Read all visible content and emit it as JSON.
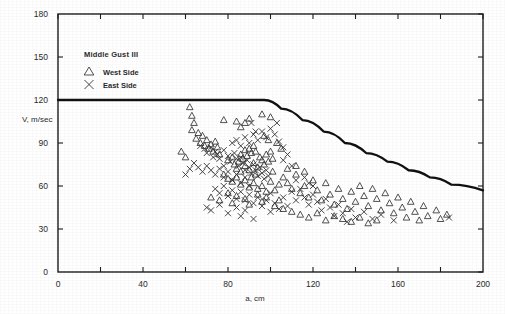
{
  "chart_data": {
    "type": "scatter",
    "title": "",
    "xlabel": "a, cm",
    "ylabel": "V, m/sec",
    "xlim": [
      0,
      200
    ],
    "ylim": [
      0,
      180
    ],
    "xticks": [
      0,
      40,
      80,
      120,
      160,
      200
    ],
    "xticks_minor": [
      20,
      60,
      100,
      140,
      180
    ],
    "yticks": [
      0,
      30,
      60,
      90,
      120,
      150,
      180
    ],
    "grid": false,
    "legend_position": "upper-left-inside",
    "legend_title": "Middle Gust III",
    "series": [
      {
        "name": "West Side",
        "marker": "triangle",
        "points": [
          [
            62,
            115
          ],
          [
            63,
            109
          ],
          [
            64,
            104
          ],
          [
            63,
            99
          ],
          [
            66,
            97
          ],
          [
            65,
            93
          ],
          [
            68,
            95
          ],
          [
            67,
            90
          ],
          [
            70,
            92
          ],
          [
            69,
            88
          ],
          [
            71,
            86
          ],
          [
            58,
            84
          ],
          [
            72,
            89
          ],
          [
            74,
            91
          ],
          [
            73,
            84
          ],
          [
            75,
            87
          ],
          [
            60,
            80
          ],
          [
            76,
            82
          ],
          [
            78,
            106
          ],
          [
            84,
            105
          ],
          [
            86,
            101
          ],
          [
            88,
            104
          ],
          [
            90,
            107
          ],
          [
            96,
            110
          ],
          [
            100,
            108
          ],
          [
            80,
            78
          ],
          [
            82,
            80
          ],
          [
            83,
            75
          ],
          [
            85,
            77
          ],
          [
            86,
            82
          ],
          [
            87,
            79
          ],
          [
            88,
            85
          ],
          [
            89,
            81
          ],
          [
            90,
            86
          ],
          [
            91,
            83
          ],
          [
            92,
            88
          ],
          [
            93,
            84
          ],
          [
            84,
            72
          ],
          [
            86,
            70
          ],
          [
            88,
            74
          ],
          [
            90,
            71
          ],
          [
            92,
            76
          ],
          [
            94,
            73
          ],
          [
            96,
            78
          ],
          [
            95,
            80
          ],
          [
            97,
            75
          ],
          [
            98,
            82
          ],
          [
            99,
            77
          ],
          [
            100,
            84
          ],
          [
            101,
            79
          ],
          [
            78,
            68
          ],
          [
            80,
            65
          ],
          [
            82,
            63
          ],
          [
            84,
            66
          ],
          [
            86,
            61
          ],
          [
            88,
            64
          ],
          [
            90,
            59
          ],
          [
            92,
            62
          ],
          [
            94,
            58
          ],
          [
            96,
            60
          ],
          [
            98,
            56
          ],
          [
            100,
            63
          ],
          [
            102,
            57
          ],
          [
            104,
            61
          ],
          [
            72,
            52
          ],
          [
            76,
            50
          ],
          [
            80,
            55
          ],
          [
            82,
            48
          ],
          [
            84,
            53
          ],
          [
            88,
            51
          ],
          [
            90,
            47
          ],
          [
            94,
            54
          ],
          [
            96,
            49
          ],
          [
            98,
            52
          ],
          [
            102,
            46
          ],
          [
            104,
            50
          ],
          [
            106,
            44
          ],
          [
            106,
            66
          ],
          [
            108,
            62
          ],
          [
            110,
            58
          ],
          [
            112,
            68
          ],
          [
            114,
            55
          ],
          [
            116,
            60
          ],
          [
            118,
            52
          ],
          [
            120,
            64
          ],
          [
            122,
            57
          ],
          [
            124,
            50
          ],
          [
            126,
            62
          ],
          [
            128,
            54
          ],
          [
            130,
            47
          ],
          [
            132,
            58
          ],
          [
            134,
            51
          ],
          [
            136,
            44
          ],
          [
            138,
            56
          ],
          [
            140,
            49
          ],
          [
            142,
            60
          ],
          [
            144,
            53
          ],
          [
            146,
            46
          ],
          [
            148,
            58
          ],
          [
            150,
            51
          ],
          [
            152,
            43
          ],
          [
            154,
            55
          ],
          [
            156,
            48
          ],
          [
            158,
            41
          ],
          [
            160,
            52
          ],
          [
            162,
            45
          ],
          [
            164,
            38
          ],
          [
            166,
            49
          ],
          [
            168,
            42
          ],
          [
            170,
            36
          ],
          [
            172,
            46
          ],
          [
            174,
            39
          ],
          [
            178,
            43
          ],
          [
            180,
            37
          ],
          [
            183,
            40
          ],
          [
            110,
            42
          ],
          [
            114,
            40
          ],
          [
            118,
            38
          ],
          [
            122,
            41
          ],
          [
            126,
            36
          ],
          [
            130,
            39
          ],
          [
            134,
            37
          ],
          [
            138,
            35
          ],
          [
            142,
            38
          ],
          [
            146,
            34
          ],
          [
            150,
            36
          ],
          [
            108,
            72
          ],
          [
            112,
            74
          ],
          [
            116,
            70
          ],
          [
            105,
            86
          ],
          [
            103,
            90
          ],
          [
            99,
            92
          ],
          [
            97,
            95
          ],
          [
            101,
            70
          ],
          [
            93,
            68
          ],
          [
            91,
            66
          ]
        ]
      },
      {
        "name": "East Side",
        "marker": "x",
        "points": [
          [
            67,
            88
          ],
          [
            69,
            86
          ],
          [
            70,
            83
          ],
          [
            72,
            87
          ],
          [
            74,
            84
          ],
          [
            73,
            80
          ],
          [
            75,
            82
          ],
          [
            76,
            79
          ],
          [
            78,
            85
          ],
          [
            80,
            81
          ],
          [
            81,
            77
          ],
          [
            83,
            83
          ],
          [
            84,
            79
          ],
          [
            85,
            74
          ],
          [
            86,
            80
          ],
          [
            87,
            76
          ],
          [
            88,
            71
          ],
          [
            89,
            78
          ],
          [
            90,
            73
          ],
          [
            91,
            69
          ],
          [
            92,
            75
          ],
          [
            93,
            71
          ],
          [
            94,
            67
          ],
          [
            95,
            73
          ],
          [
            96,
            69
          ],
          [
            97,
            65
          ],
          [
            98,
            71
          ],
          [
            99,
            67
          ],
          [
            82,
            90
          ],
          [
            84,
            92
          ],
          [
            86,
            88
          ],
          [
            88,
            94
          ],
          [
            90,
            90
          ],
          [
            92,
            96
          ],
          [
            94,
            92
          ],
          [
            96,
            98
          ],
          [
            98,
            94
          ],
          [
            100,
            100
          ],
          [
            102,
            96
          ],
          [
            104,
            91
          ],
          [
            106,
            87
          ],
          [
            64,
            76
          ],
          [
            66,
            73
          ],
          [
            68,
            70
          ],
          [
            70,
            74
          ],
          [
            72,
            71
          ],
          [
            74,
            68
          ],
          [
            76,
            72
          ],
          [
            78,
            66
          ],
          [
            80,
            70
          ],
          [
            82,
            64
          ],
          [
            84,
            68
          ],
          [
            86,
            62
          ],
          [
            88,
            66
          ],
          [
            90,
            60
          ],
          [
            74,
            58
          ],
          [
            76,
            55
          ],
          [
            78,
            60
          ],
          [
            80,
            53
          ],
          [
            82,
            57
          ],
          [
            84,
            51
          ],
          [
            86,
            56
          ],
          [
            88,
            50
          ],
          [
            90,
            54
          ],
          [
            92,
            48
          ],
          [
            94,
            52
          ],
          [
            96,
            46
          ],
          [
            98,
            50
          ],
          [
            100,
            55
          ],
          [
            70,
            45
          ],
          [
            72,
            43
          ],
          [
            76,
            47
          ],
          [
            80,
            41
          ],
          [
            84,
            45
          ],
          [
            86,
            39
          ],
          [
            88,
            43
          ],
          [
            92,
            37
          ],
          [
            100,
            42
          ],
          [
            102,
            48
          ],
          [
            104,
            44
          ],
          [
            106,
            52
          ],
          [
            108,
            46
          ],
          [
            110,
            56
          ],
          [
            112,
            50
          ],
          [
            114,
            58
          ],
          [
            116,
            52
          ],
          [
            118,
            47
          ],
          [
            120,
            54
          ],
          [
            122,
            49
          ],
          [
            124,
            43
          ],
          [
            126,
            51
          ],
          [
            128,
            45
          ],
          [
            130,
            39
          ],
          [
            132,
            47
          ],
          [
            134,
            41
          ],
          [
            136,
            35
          ],
          [
            138,
            44
          ],
          [
            140,
            38
          ],
          [
            144,
            42
          ],
          [
            148,
            37
          ],
          [
            152,
            40
          ],
          [
            158,
            36
          ],
          [
            184,
            38
          ],
          [
            106,
            78
          ],
          [
            108,
            82
          ],
          [
            110,
            74
          ],
          [
            103,
            104
          ],
          [
            91,
            104
          ],
          [
            93,
            98
          ],
          [
            78,
            74
          ],
          [
            62,
            72
          ],
          [
            60,
            68
          ],
          [
            118,
            62
          ],
          [
            116,
            66
          ],
          [
            120,
            60
          ],
          [
            112,
            64
          ]
        ]
      }
    ],
    "envelope_curve": {
      "description": "upper bound envelope",
      "plateau_value": 120,
      "knee_x": 97,
      "end_value": 57,
      "points": [
        [
          0,
          120
        ],
        [
          97,
          120
        ],
        [
          105,
          114
        ],
        [
          115,
          106
        ],
        [
          125,
          98
        ],
        [
          135,
          90
        ],
        [
          145,
          83
        ],
        [
          155,
          77
        ],
        [
          165,
          71
        ],
        [
          175,
          66
        ],
        [
          185,
          61
        ],
        [
          200,
          57
        ]
      ]
    }
  }
}
